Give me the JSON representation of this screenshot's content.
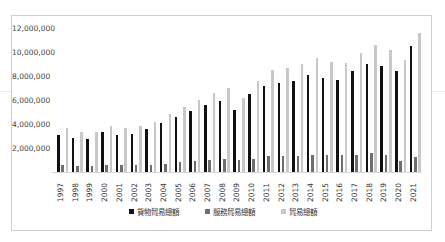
{
  "chart_data": {
    "type": "bar",
    "title": "",
    "xlabel": "",
    "ylabel": "",
    "ylim": [
      0,
      12000000
    ],
    "yticks": [
      "2,000,000",
      "4,000,000",
      "6,000,000",
      "8,000,000",
      "10,000,000",
      "12,000,000"
    ],
    "ytick_values": [
      2000000,
      4000000,
      6000000,
      8000000,
      10000000,
      12000000
    ],
    "grid": false,
    "legend_position": "bottom",
    "categories": [
      "1997",
      "1998",
      "1999",
      "2000",
      "2001",
      "2002",
      "2003",
      "2004",
      "2005",
      "2006",
      "2007",
      "2008",
      "2009",
      "2010",
      "2011",
      "2012",
      "2013",
      "2014",
      "2015",
      "2016",
      "2017",
      "2018",
      "2019",
      "2020",
      "2021"
    ],
    "series": [
      {
        "name": "貨物貿易總額",
        "color": "#111111",
        "values": [
          3080000,
          2800000,
          2750000,
          3300000,
          3100000,
          3200000,
          3600000,
          4100000,
          4600000,
          5100000,
          5600000,
          5950000,
          5200000,
          6500000,
          7200000,
          7400000,
          7600000,
          8100000,
          7800000,
          7700000,
          8400000,
          9000000,
          8800000,
          8400000,
          10500000
        ]
      },
      {
        "name": "服務貿易總額",
        "color": "#6e6e6e",
        "values": [
          580000,
          500000,
          500000,
          600000,
          550000,
          550000,
          600000,
          700000,
          800000,
          900000,
          1000000,
          1050000,
          1000000,
          1100000,
          1300000,
          1300000,
          1350000,
          1400000,
          1400000,
          1400000,
          1450000,
          1550000,
          1450000,
          900000,
          1250000
        ]
      },
      {
        "name": "貿易總額",
        "color": "#c8c8c8",
        "values": [
          3670000,
          3300000,
          3300000,
          3850000,
          3650000,
          3800000,
          4200000,
          4800000,
          5400000,
          6000000,
          6600000,
          7000000,
          6200000,
          7600000,
          8500000,
          8700000,
          9000000,
          9500000,
          9200000,
          9100000,
          9900000,
          10600000,
          10200000,
          9300000,
          11600000
        ]
      }
    ]
  },
  "legend": {
    "goods_label": "貨物貿易總額",
    "services_label": "服務貿易總額",
    "total_label": "貿易總額"
  }
}
